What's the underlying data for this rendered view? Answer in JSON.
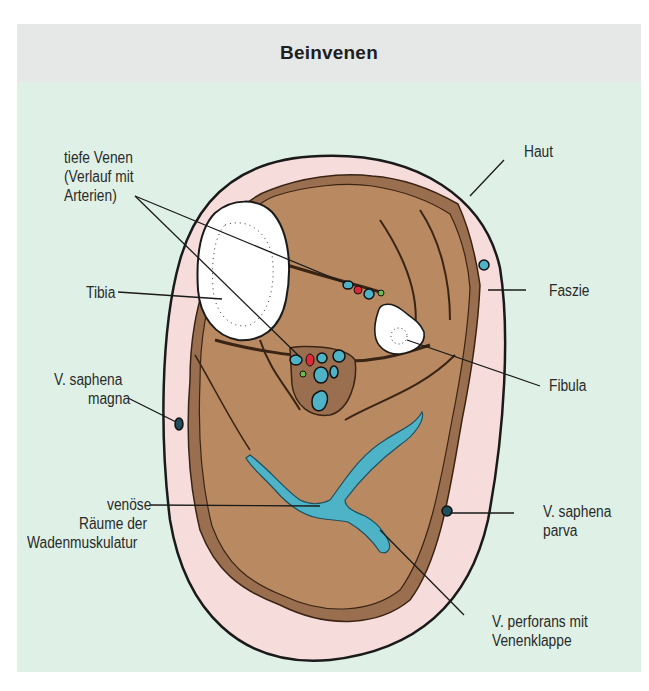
{
  "figure": {
    "title": "Beinvenen",
    "colors": {
      "header_bg": "#e6e8e8",
      "body_bg": "#dff1e6",
      "skin": "#f7dcdc",
      "muscle": "#b98a62",
      "fascia": "#9a6f4f",
      "bone": "#ffffff",
      "vein": "#4fb3c8",
      "artery": "#e0283a",
      "nerve": "#6dbb4a",
      "outline": "#1a1a1a"
    }
  },
  "labels": {
    "tiefe_venen": "tiefe Venen",
    "tiefe_venen_2": "(Verlauf mit",
    "tiefe_venen_3": "Arterien)",
    "haut": "Haut",
    "tibia": "Tibia",
    "faszie": "Faszie",
    "fibula": "Fibula",
    "saphena_magna_1": "V. saphena",
    "saphena_magna_2": "magna",
    "venoese_1": "venöse",
    "venoese_2": "Räume der",
    "venoese_3": "Wadenmuskulatur",
    "saphena_parva_1": "V. saphena",
    "saphena_parva_2": "parva",
    "perforans_1": "V. perforans mit",
    "perforans_2": "Venenklappe"
  }
}
